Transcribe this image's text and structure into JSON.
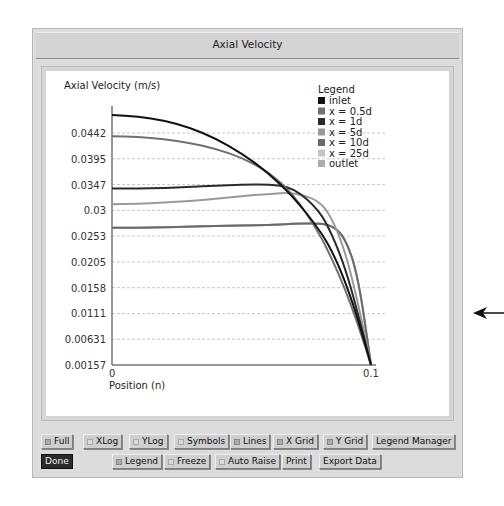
{
  "window": {
    "title": "Axial Velocity"
  },
  "chart_data": {
    "type": "line",
    "title": "",
    "ylabel": "Axial Velocity (m/s)",
    "xlabel": "Position (n)",
    "xlim": [
      0,
      0.1
    ],
    "ylim": [
      0.00157,
      0.0489
    ],
    "x_ticks": [
      "0",
      "0.1"
    ],
    "y_ticks": [
      "0.0442",
      "0.0395",
      "0.0347",
      "0.03",
      "0.0253",
      "0.0205",
      "0.0158",
      "0.0111",
      "0.00631",
      "0.00157"
    ],
    "grid": true,
    "legend_title": "Legend",
    "legend_position": "top-right",
    "x": [
      0,
      0.01,
      0.02,
      0.03,
      0.04,
      0.05,
      0.06,
      0.07,
      0.08,
      0.085,
      0.09,
      0.095,
      0.1
    ],
    "series": [
      {
        "name": "inlet",
        "color": "#111111",
        "values": [
          0.0475,
          0.0472,
          0.0465,
          0.0452,
          0.0432,
          0.0405,
          0.037,
          0.0325,
          0.0265,
          0.0225,
          0.017,
          0.01,
          0.00157
        ]
      },
      {
        "name": "x = 0.5d",
        "color": "#707070",
        "values": [
          0.0436,
          0.0435,
          0.0431,
          0.0424,
          0.0413,
          0.0397,
          0.0372,
          0.033,
          0.0258,
          0.021,
          0.0155,
          0.009,
          0.00157
        ]
      },
      {
        "name": "x = 1d",
        "color": "#2a2a2a",
        "values": [
          0.034,
          0.034,
          0.0341,
          0.0343,
          0.0345,
          0.0347,
          0.0348,
          0.0342,
          0.03,
          0.0255,
          0.0195,
          0.011,
          0.00157
        ]
      },
      {
        "name": "x = 5d",
        "color": "#9a9a9a",
        "values": [
          0.0311,
          0.0312,
          0.0314,
          0.0317,
          0.0321,
          0.0326,
          0.033,
          0.0333,
          0.0318,
          0.0285,
          0.0225,
          0.013,
          0.00157
        ]
      },
      {
        "name": "x = 10d",
        "color": "#6a6a6a",
        "values": [
          0.0268,
          0.0268,
          0.0269,
          0.027,
          0.0271,
          0.0272,
          0.0273,
          0.0275,
          0.0276,
          0.0272,
          0.025,
          0.018,
          0.00157
        ]
      },
      {
        "name": "x = 25d",
        "color": "#c4c4c4",
        "values": [
          0.0268,
          0.0268,
          0.0269,
          0.027,
          0.0271,
          0.0272,
          0.0273,
          0.0275,
          0.0276,
          0.0272,
          0.025,
          0.018,
          0.00157
        ]
      },
      {
        "name": "outlet",
        "color": "#acacac",
        "values": [
          0.0268,
          0.0268,
          0.0269,
          0.027,
          0.0271,
          0.0272,
          0.0273,
          0.0275,
          0.0276,
          0.0272,
          0.025,
          0.018,
          0.00157
        ]
      }
    ]
  },
  "buttons": {
    "row1": [
      {
        "label": "Full",
        "indicator": "on"
      },
      {
        "label": "XLog",
        "indicator": "off"
      },
      {
        "label": "YLog",
        "indicator": "off"
      },
      {
        "label": "Symbols",
        "indicator": "off"
      },
      {
        "label": "Lines",
        "indicator": "on"
      },
      {
        "label": "X Grid",
        "indicator": "on"
      },
      {
        "label": "Y Grid",
        "indicator": "on"
      },
      {
        "label": "Legend Manager",
        "indicator": "none"
      }
    ],
    "row2": [
      {
        "label": "Done",
        "indicator": "none"
      },
      {
        "label": "Legend",
        "indicator": "on"
      },
      {
        "label": "Freeze",
        "indicator": "off"
      },
      {
        "label": "Auto Raise",
        "indicator": "off"
      },
      {
        "label": "Print",
        "indicator": "none"
      },
      {
        "label": "Export Data",
        "indicator": "none"
      }
    ]
  }
}
